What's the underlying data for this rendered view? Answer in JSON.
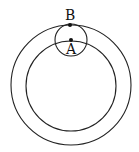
{
  "diagram": {
    "stroke_color": "#222222",
    "outer_circle": {
      "cx": 71,
      "cy": 85,
      "r": 60
    },
    "inner_circle": {
      "cx": 71,
      "cy": 86,
      "r": 45
    },
    "small_circle": {
      "cx": 71,
      "cy": 40,
      "r": 16
    },
    "points": [
      {
        "label": "B",
        "x": 70,
        "y": 25
      },
      {
        "label": "A",
        "x": 71,
        "y": 40
      }
    ]
  }
}
